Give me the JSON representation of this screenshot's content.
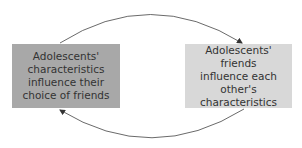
{
  "diagram": {
    "type": "cycle",
    "nodes": [
      {
        "id": "left",
        "text": "Adolescents'\ncharacteristics\ninfluence their\nchoice of friends",
        "fill": "#a8a8a8"
      },
      {
        "id": "right",
        "text": "Adolescents' friends\ninfluence each\nother's characteristics",
        "fill": "#d8d8d8"
      }
    ],
    "edges": [
      {
        "from": "left",
        "to": "right",
        "position": "top"
      },
      {
        "from": "right",
        "to": "left",
        "position": "bottom"
      }
    ]
  }
}
